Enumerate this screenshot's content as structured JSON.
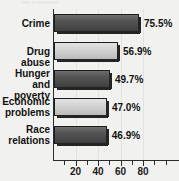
{
  "title_remnant": "▪▪▪▪  ▪▪  ▪▪▪▪▪▪▪▪▪▪",
  "chart_data": {
    "type": "bar",
    "orientation": "horizontal",
    "title": "",
    "xlabel": "",
    "ylabel": "",
    "xlim": [
      0,
      90
    ],
    "grid": true,
    "legend": false,
    "categories": [
      "Crime",
      "Drug abuse",
      "Hunger and poverty",
      "Economic problems",
      "Race relations"
    ],
    "category_lines": [
      [
        "Crime"
      ],
      [
        "Drug abuse"
      ],
      [
        "Hunger and",
        "poverty"
      ],
      [
        "Economic",
        "problems"
      ],
      [
        "Race",
        "relations"
      ]
    ],
    "values": [
      75.5,
      56.9,
      49.7,
      47.0,
      46.9
    ],
    "value_labels": [
      "75.5%",
      "56.9%",
      "49.7%",
      "47.0%",
      "46.9%"
    ],
    "bar_styles": [
      "dark",
      "light",
      "dark",
      "light",
      "dark"
    ],
    "tick_labels": [
      "20",
      "40",
      "60",
      "80"
    ],
    "tick_values": [
      20,
      40,
      60,
      80
    ],
    "minor_tick_values": [
      10,
      30,
      50,
      70
    ],
    "gridline_values": [
      20,
      40,
      60,
      80
    ],
    "colors": {
      "bar_dark": "#4a4a4a",
      "bar_light": "#c6c6c6",
      "axis": "#2b2b2b",
      "grid": "#e2e2e0",
      "background": "#f1f1ef",
      "text": "#111111"
    }
  }
}
